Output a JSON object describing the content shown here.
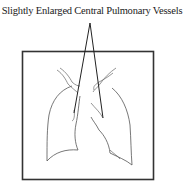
{
  "figure": {
    "label": "Slightly Enlarged Central Pulmonary Vessels",
    "elements": [
      "frame",
      "right-lung-outline",
      "left-lung-outline",
      "hilar-vessels",
      "pointer-lines"
    ]
  },
  "colors": {
    "background": "#ffffff",
    "line": "#222222",
    "outline": "#555555"
  }
}
